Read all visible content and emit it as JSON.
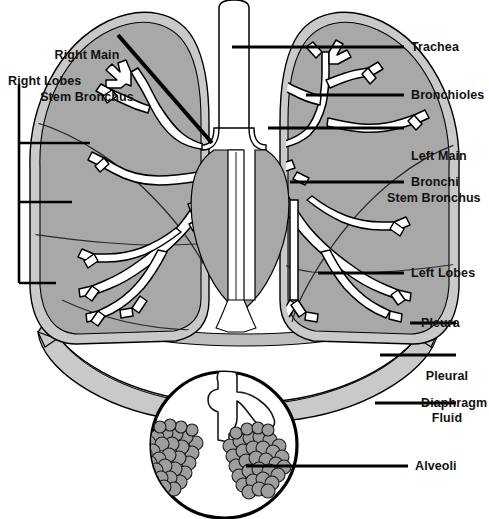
{
  "diagram": {
    "type": "anatomical-illustration",
    "canvas": {
      "width": 489,
      "height": 519,
      "background": "#ffffff"
    },
    "colors": {
      "lung_parenchyma": "#a8a8a8",
      "pleura_outer": "#c9c9c9",
      "pleural_fluid": "#bdbdbd",
      "airway_lumen": "#ffffff",
      "outline": "#000000",
      "alveoli_fill": "#9e9e9e",
      "label_text": "#111111",
      "leader_line": "#000000"
    }
  },
  "labels": {
    "right_main_stem_bronchus": {
      "line1": "Right Main",
      "line2": "Stem Bronchus"
    },
    "right_lobes": "Right Lobes",
    "trachea": "Trachea",
    "bronchioles": "Bronchioles",
    "left_main_stem_bronchus": {
      "line1": "Left Main",
      "line2": "Stem Bronchus"
    },
    "bronchi": "Bronchi",
    "left_lobes": "Left Lobes",
    "pleura": "Pleura",
    "pleural_fluid": {
      "line1": "Pleural",
      "line2": "Fluid"
    },
    "diaphragm": "Diaphragm",
    "alveoli": "Alveoli"
  },
  "structures": [
    {
      "name": "trachea",
      "side": "center",
      "description": "Central vertical windpipe tube"
    },
    {
      "name": "right-lung",
      "side": "right-anatomical",
      "lobes": 3
    },
    {
      "name": "left-lung",
      "side": "left-anatomical",
      "lobes": 2
    },
    {
      "name": "bronchial-tree",
      "side": "both"
    },
    {
      "name": "diaphragm",
      "side": "center",
      "description": "Dome sheet beneath lungs"
    },
    {
      "name": "alveoli-inset",
      "side": "center-bottom",
      "description": "Magnified circle of alveolar sacs"
    }
  ]
}
